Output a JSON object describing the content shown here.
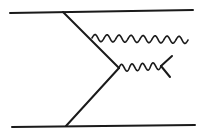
{
  "diagram": {
    "type": "feynman-diagram",
    "colors": {
      "line": "#1a1a1a",
      "background": "#ffffff"
    },
    "fermion_lines": [
      {
        "name": "top-line",
        "from": [
          10,
          13
        ],
        "to": [
          193,
          10
        ]
      },
      {
        "name": "bottom-line",
        "from": [
          12,
          127
        ],
        "to": [
          195,
          125
        ]
      },
      {
        "name": "upper-internal-line",
        "from": [
          63,
          12
        ],
        "to": [
          119,
          68
        ]
      },
      {
        "name": "lower-internal-line",
        "from": [
          66,
          126
        ],
        "to": [
          119,
          68
        ]
      },
      {
        "name": "fork-upper-branch",
        "from": [
          161,
          66
        ],
        "to": [
          172,
          56
        ]
      },
      {
        "name": "fork-lower-branch",
        "from": [
          161,
          66
        ],
        "to": [
          170,
          77
        ]
      }
    ],
    "boson_lines": [
      {
        "name": "upper-gluon",
        "from": [
          92,
          38
        ],
        "to": [
          188,
          40
        ],
        "humps": 8,
        "amplitude": 3.5
      },
      {
        "name": "lower-gluon",
        "from": [
          119,
          68
        ],
        "to": [
          161,
          66
        ],
        "humps": 4,
        "amplitude": 3.5
      }
    ]
  }
}
